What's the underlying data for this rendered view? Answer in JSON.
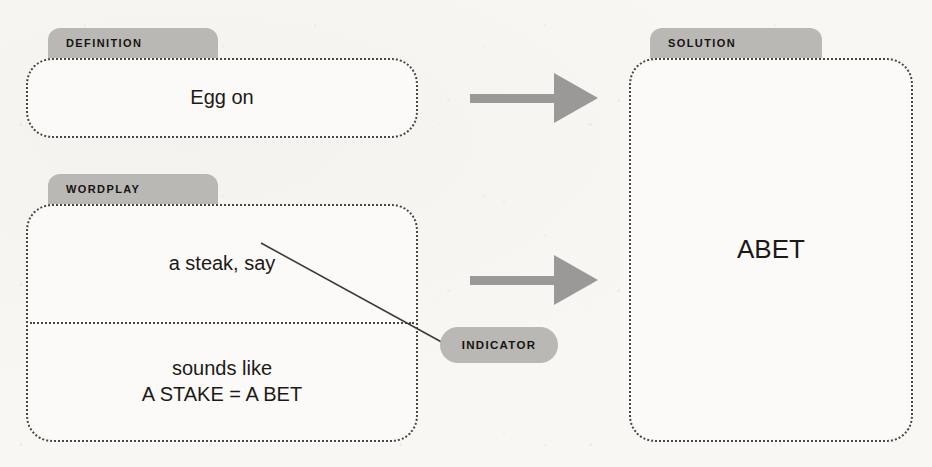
{
  "theme": {
    "background": "#f7f6f3",
    "panel_fill": "#fbfaf8",
    "panel_border": "#4a4742",
    "tab_fill": "#b9b8b5",
    "arrow_fill": "#9a9997",
    "text": "#1c1a16"
  },
  "diagram": {
    "definition": {
      "tab_label": "DEFINITION",
      "text": "Egg on"
    },
    "wordplay": {
      "tab_label": "WORDPLAY",
      "fodder": "a steak, say",
      "explanation_line1": "sounds like",
      "explanation_line2": "A STAKE = A BET"
    },
    "indicator": {
      "label": "INDICATOR"
    },
    "solution": {
      "tab_label": "SOLUTION",
      "text": "ABET"
    },
    "arrows": [
      {
        "name": "definition-to-solution-arrow"
      },
      {
        "name": "wordplay-to-solution-arrow"
      }
    ]
  }
}
